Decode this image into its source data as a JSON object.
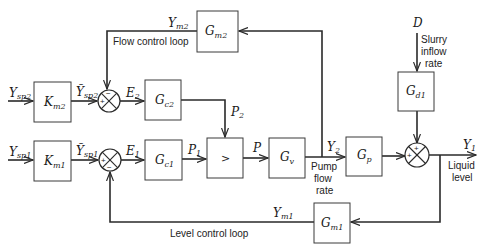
{
  "diagram": {
    "blocks": {
      "km2": {
        "main": "K",
        "sub": "m2"
      },
      "km1": {
        "main": "K",
        "sub": "m1"
      },
      "gc2": {
        "main": "G",
        "sub": "c2"
      },
      "gc1": {
        "main": "G",
        "sub": "c1"
      },
      "selector": {
        "main": ">"
      },
      "gv": {
        "main": "G",
        "sub": "v"
      },
      "gp": {
        "main": "G",
        "sub": "p"
      },
      "gd1": {
        "main": "G",
        "sub": "d1"
      },
      "gm2": {
        "main": "G",
        "sub": "m2"
      },
      "gm1": {
        "main": "G",
        "sub": "m1"
      }
    },
    "signals": {
      "ysp2": {
        "main": "Y",
        "sub": "sp2"
      },
      "ysp1": {
        "main": "Y",
        "sub": "sp1"
      },
      "ysp2_tilde": {
        "main": "Ỹ",
        "sub": "sp2"
      },
      "ysp1_tilde": {
        "main": "Ỹ",
        "sub": "sp1"
      },
      "e2": {
        "main": "E",
        "sub": "2"
      },
      "e1": {
        "main": "E",
        "sub": "1"
      },
      "p2": {
        "main": "P",
        "sub": "2"
      },
      "p1": {
        "main": "P",
        "sub": "1"
      },
      "p": {
        "main": "P"
      },
      "y2": {
        "main": "Y",
        "sub": "2"
      },
      "y1": {
        "main": "Y",
        "sub": "1"
      },
      "ym2": {
        "main": "Y",
        "sub": "m2"
      },
      "ym1": {
        "main": "Y",
        "sub": "m1"
      },
      "d": {
        "main": "D"
      }
    },
    "signs": {
      "sum2_plus": "+",
      "sum2_minus": "−",
      "sum1_plus": "+",
      "sum1_minus": "−",
      "sum3_plus_top": "+",
      "sum3_plus_left": "+"
    },
    "annotations": {
      "flow_loop": "Flow control loop",
      "level_loop": "Level control loop",
      "slurry_1": "Slurry",
      "slurry_2": "inflow",
      "slurry_3": "rate",
      "pump_1": "Pump",
      "pump_2": "flow",
      "pump_3": "rate",
      "liquid_1": "Liquid",
      "liquid_2": "level"
    }
  }
}
